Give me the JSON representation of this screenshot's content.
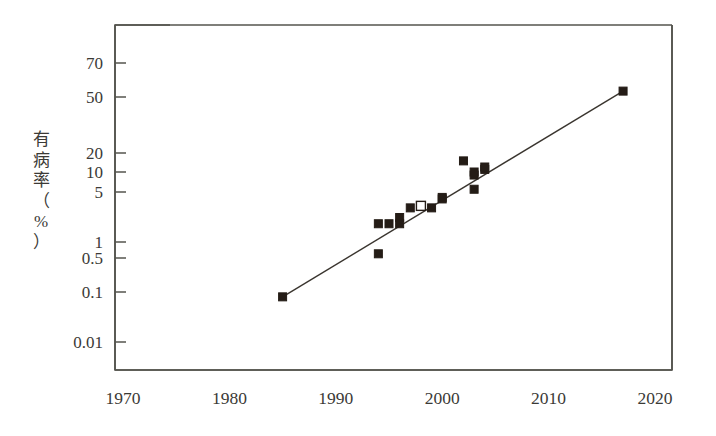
{
  "chart_data": {
    "type": "scatter",
    "title": "",
    "xlabel": "",
    "ylabel": "有病率（%）",
    "ylabel_chars": [
      "有",
      "病",
      "率",
      "（",
      "%",
      "）"
    ],
    "xlim": [
      1970,
      2020
    ],
    "ylim": [
      0.01,
      90
    ],
    "yscale": "log",
    "grid": false,
    "legend": null,
    "xticks": [
      1970,
      1980,
      1990,
      2000,
      2010,
      2020
    ],
    "xtick_labels": [
      "1970",
      "1980",
      "1990",
      "2000",
      "2010",
      "2020"
    ],
    "yticks": [
      70,
      50,
      20,
      10,
      5,
      1,
      0.5,
      0.1,
      0.01
    ],
    "ytick_labels": [
      "70",
      "50",
      "20",
      "10",
      "5",
      "1",
      "0.5",
      "0.1",
      "0.01"
    ],
    "ytick_pixels": [
      63,
      97,
      153,
      172,
      192,
      242,
      258,
      292,
      342
    ],
    "series": [
      {
        "name": "observed-prevalence",
        "marker": "filled-square",
        "x": [
          1985,
          1994,
          1994,
          1995,
          1996,
          1996,
          1997,
          1999,
          2000,
          2000,
          2002,
          2003,
          2003,
          2003,
          2004,
          2004,
          2017
        ],
        "y": [
          0.08,
          0.6,
          1.8,
          1.8,
          2.2,
          1.8,
          3.0,
          3.0,
          4.0,
          4.2,
          15.0,
          9.0,
          5.5,
          10.0,
          11.0,
          12.0,
          53.0
        ]
      },
      {
        "name": "highlighted-point",
        "marker": "open-square",
        "x": [
          1998
        ],
        "y": [
          3.2
        ]
      }
    ],
    "trendline": {
      "name": "regression-line",
      "x": [
        1985,
        2017
      ],
      "y": [
        0.08,
        53.0
      ]
    },
    "colors": {
      "marker": "#241c16",
      "line": "#3a352f",
      "axis": "#54544e",
      "text": "#3b3a36",
      "background": "#ffffff"
    }
  }
}
